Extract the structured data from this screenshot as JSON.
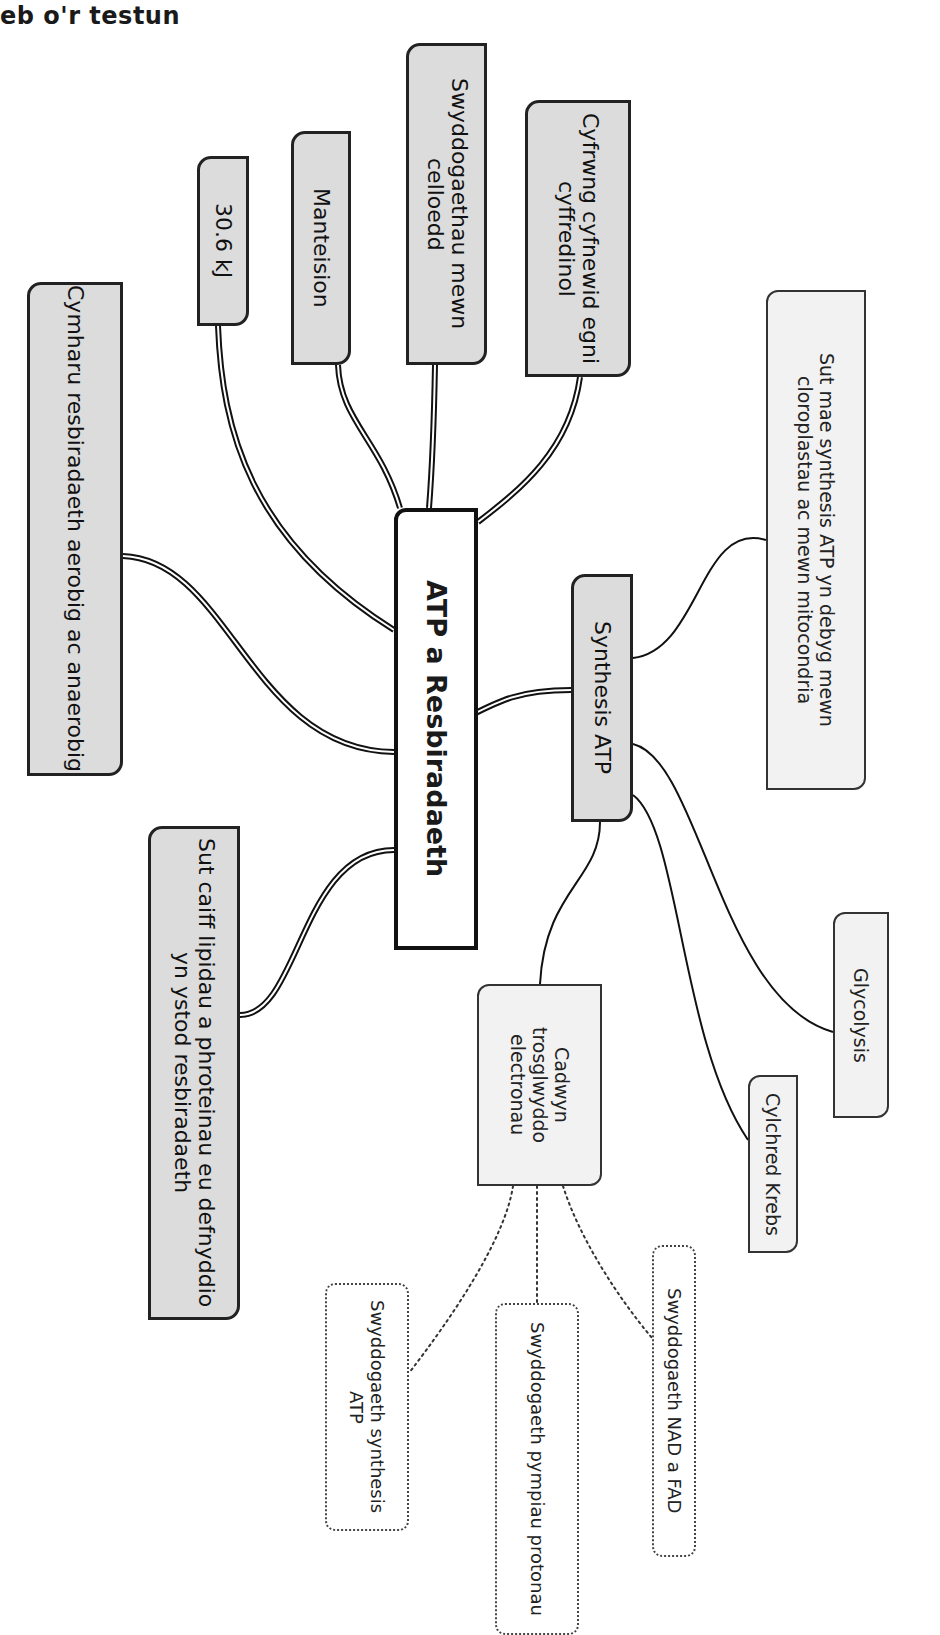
{
  "heading": "eb o'r testun",
  "colors": {
    "main_fill": "#dcdcdc",
    "sub_fill": "#f2f2f2",
    "center_fill": "#ffffff",
    "stroke": "#111111"
  },
  "central_node": {
    "id": "atp-resbiradaeth",
    "label": "ATP a Resbiradaeth",
    "box": [
      394,
      508,
      84,
      442
    ]
  },
  "main_nodes": [
    {
      "id": "cymharu",
      "label": "Cymharu resbiradaeth aerobig ac anaerobig",
      "box": [
        27,
        282,
        96,
        494
      ]
    },
    {
      "id": "30-6-kj",
      "label": "30.6 kJ",
      "box": [
        197,
        156,
        52,
        170
      ]
    },
    {
      "id": "manteision",
      "label": "Manteision",
      "box": [
        291,
        131,
        60,
        234
      ]
    },
    {
      "id": "swyddogaethau",
      "label": "Swyddogaethau mewn celloedd",
      "box": [
        406,
        43,
        81,
        322
      ]
    },
    {
      "id": "cyfrwng",
      "label": "Cyfrwng cyfnewid egni cyffredinol",
      "box": [
        525,
        100,
        106,
        277
      ]
    },
    {
      "id": "synthesis-atp",
      "label": "Synthesis ATP",
      "box": [
        571,
        574,
        62,
        248
      ]
    },
    {
      "id": "sut-caiff-lipidau",
      "label": "Sut caiff lipidau a phroteinau eu defnyddio yn ystod resbiradaeth",
      "box": [
        148,
        826,
        92,
        494
      ]
    }
  ],
  "sub_nodes": [
    {
      "id": "sut-mae-synthesis",
      "label": "Sut mae synthesis ATP yn debyg mewn cloroplastau ac mewn mitocondria",
      "box": [
        766,
        290,
        100,
        500
      ]
    },
    {
      "id": "glycolysis",
      "label": "Glycolysis",
      "box": [
        833,
        912,
        56,
        206
      ]
    },
    {
      "id": "cylchred-krebs",
      "label": "Cylchred Krebs",
      "box": [
        748,
        1075,
        50,
        178
      ]
    },
    {
      "id": "cadwyn",
      "label": "Cadwyn trosglwyddo electronau",
      "box": [
        477,
        984,
        125,
        202
      ]
    }
  ],
  "dotted_nodes": [
    {
      "id": "swyddogaeth-nad-fad",
      "label": "Swyddogaeth NAD a FAD",
      "box": [
        652,
        1245,
        44,
        312
      ]
    },
    {
      "id": "swyddogaeth-pympiau",
      "label": "Swyddogaeth pympiau protonau",
      "box": [
        495,
        1303,
        84,
        332
      ]
    },
    {
      "id": "swyddogaeth-synthesis",
      "label": "Swyddogaeth synthesis ATP",
      "box": [
        325,
        1283,
        84,
        248
      ]
    }
  ],
  "links": {
    "double": [
      "M 218 326 C 222 430, 250 540, 394 630",
      "M 338 365 C 340 420, 380 440, 400 508",
      "M 435 365 C 434 420, 432 470, 429 508",
      "M 580 377 C 570 450, 520 490, 478 522",
      "M 123 556 C 230 560, 250 750, 394 752",
      "M 462 720 C 500 700, 520 690, 571 690",
      "M 240 1015 C 300 1015, 300 850, 394 850"
    ],
    "single": [
      "M 633 658 C 700 650, 700 520, 766 540",
      "M 633 744 C 700 760, 720 1000, 833 1032",
      "M 633 795 C 680 830, 680 1040, 748 1140",
      "M 600 822 C 600 880, 545 890, 540 984"
    ],
    "dotted": [
      "M 513 1186 C 505 1240, 450 1320, 409 1373",
      "M 537 1186 L 537 1303",
      "M 563 1186 C 580 1240, 620 1300, 652 1338"
    ]
  }
}
